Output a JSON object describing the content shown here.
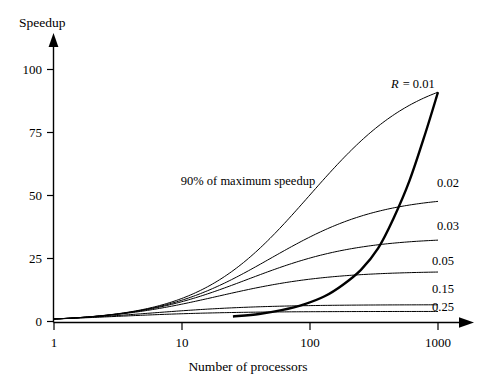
{
  "chart_data": {
    "type": "line",
    "title": "",
    "xlabel": "Number of processors",
    "ylabel": "Speedup",
    "xscale": "log",
    "xlim": [
      1,
      1000
    ],
    "ylim": [
      0,
      110
    ],
    "xticks": [
      "1",
      "10",
      "100",
      "1000"
    ],
    "xtick_values": [
      1,
      10,
      100,
      1000
    ],
    "yticks": [
      "0",
      "25",
      "50",
      "75",
      "100"
    ],
    "ytick_values": [
      0,
      25,
      50,
      75,
      100
    ],
    "grid": false,
    "legend_position": "inline-right-of-curves",
    "annotations": [
      {
        "text": "90% of maximum speedup",
        "x_px": 248,
        "y_px": 181,
        "describes": "bold-90pct-curve"
      }
    ],
    "series": [
      {
        "name": "R = 0.01",
        "label": "R = 0.01",
        "label_math": "R",
        "label_value": "= 0.01",
        "R": 0.01,
        "formula": "S(n) = n / (1 + R*(n-1))",
        "endpoint_speedup": 91,
        "x": [
          1,
          2,
          3,
          5,
          10,
          20,
          30,
          50,
          100,
          200,
          300,
          500,
          1000
        ],
        "values": [
          1,
          1.98,
          2.94,
          4.81,
          9.17,
          16.81,
          23.08,
          33.56,
          50.25,
          67.11,
          75.76,
          83.75,
          91.74
        ]
      },
      {
        "name": "0.02",
        "label": "0.02",
        "R": 0.02,
        "endpoint_speedup": 50,
        "x": [
          1,
          2,
          3,
          5,
          10,
          20,
          30,
          50,
          100,
          200,
          300,
          500,
          1000
        ],
        "values": [
          1,
          1.96,
          2.88,
          4.63,
          8.47,
          14.49,
          18.99,
          25.77,
          33.56,
          40.49,
          43.35,
          45.87,
          48.08
        ]
      },
      {
        "name": "0.03",
        "label": "0.03",
        "R": 0.03,
        "endpoint_speedup": 34,
        "x": [
          1,
          2,
          3,
          5,
          10,
          20,
          30,
          50,
          100,
          200,
          300,
          500,
          1000
        ],
        "values": [
          1,
          1.94,
          2.83,
          4.46,
          7.87,
          12.74,
          16.06,
          20.66,
          25.19,
          28.45,
          29.62,
          30.59,
          31.37
        ]
      },
      {
        "name": "0.05",
        "label": "0.05",
        "R": 0.05,
        "endpoint_speedup": 21,
        "x": [
          1,
          2,
          3,
          5,
          10,
          20,
          30,
          50,
          100,
          200,
          300,
          500,
          1000
        ],
        "values": [
          1,
          1.9,
          2.73,
          4.17,
          6.9,
          10.26,
          12.24,
          14.71,
          16.81,
          18.18,
          18.63,
          18.99,
          19.27
        ]
      },
      {
        "name": "0.15",
        "label": "0.15",
        "R": 0.15,
        "endpoint_speedup": 9,
        "x": [
          1,
          2,
          3,
          5,
          10,
          20,
          30,
          50,
          100,
          200,
          300,
          500,
          1000
        ],
        "values": [
          1,
          1.74,
          2.31,
          3.08,
          4.21,
          5.16,
          5.56,
          5.9,
          6.18,
          6.32,
          6.37,
          6.41,
          6.44
        ]
      },
      {
        "name": "0.25",
        "label": "0.25",
        "R": 0.25,
        "endpoint_speedup": 5,
        "x": [
          1,
          2,
          3,
          5,
          10,
          20,
          30,
          50,
          100,
          200,
          300,
          500,
          1000
        ],
        "values": [
          1,
          1.6,
          2.0,
          2.5,
          3.08,
          3.48,
          3.61,
          3.72,
          3.82,
          3.87,
          3.88,
          3.89,
          3.9
        ]
      },
      {
        "name": "90% of maximum speedup",
        "label": "90% of maximum speedup",
        "bold": true,
        "description": "Locus of points where speedup reaches 90% of the asymptotic maximum 1/R",
        "x": [
          25,
          40,
          60,
          90,
          130,
          180,
          250,
          340,
          450,
          600,
          800,
          1000
        ],
        "values": [
          2.0,
          3.0,
          4.5,
          6.8,
          10.0,
          14.5,
          20.5,
          29.0,
          41.0,
          56.0,
          75.0,
          91.0
        ]
      }
    ]
  },
  "labels": {
    "y_axis_title": "Speedup",
    "x_axis_title": "Number of processors",
    "r_prefix": "R",
    "r_suffix": "= 0.01",
    "annotation_90pct": "90% of maximum speedup",
    "series_labels": [
      "0.02",
      "0.03",
      "0.05",
      "0.15",
      "0.25"
    ],
    "ytick_0": "0",
    "ytick_25": "25",
    "ytick_50": "50",
    "ytick_75": "75",
    "ytick_100": "100",
    "xtick_1": "1",
    "xtick_10": "10",
    "xtick_100": "100",
    "xtick_1000": "1000"
  },
  "colors": {
    "axis": "#000000",
    "curve": "#000000",
    "background": "#ffffff"
  }
}
